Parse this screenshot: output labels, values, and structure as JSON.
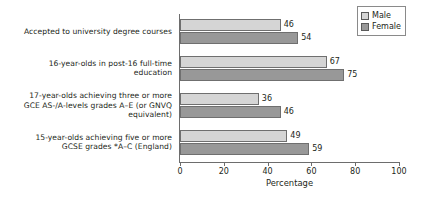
{
  "chart_data": {
    "type": "bar",
    "orientation": "horizontal",
    "title": "",
    "xlabel": "Percentage",
    "ylabel": "",
    "xlim": [
      0,
      100
    ],
    "xticks": [
      0,
      20,
      40,
      60,
      80,
      100
    ],
    "grid": false,
    "legend_position": "top-right",
    "categories": [
      "Accepted to university degree courses",
      "16-year-olds in post-16 full-time education",
      "17-year-olds achieving three or more GCE AS-/A-levels grades A–E (or GNVQ equivalent)",
      "15-year-olds achieving five or more GCSE grades *A–C (England)"
    ],
    "category_lines": [
      [
        "Accepted to university degree courses"
      ],
      [
        "16-year-olds in post-16 full-time",
        "education"
      ],
      [
        "17-year-olds achieving three or more",
        "GCE AS-/A-levels grades A–E (or GNVQ",
        "equivalent)"
      ],
      [
        "15-year-olds achieving five or more",
        "GCSE grades *A–C (England)"
      ]
    ],
    "series": [
      {
        "name": "Male",
        "color": "#d5d5d5",
        "values": [
          46,
          67,
          36,
          49
        ]
      },
      {
        "name": "Female",
        "color": "#989898",
        "values": [
          54,
          75,
          46,
          59
        ]
      }
    ]
  },
  "legend": {
    "items": [
      {
        "label": "Male"
      },
      {
        "label": "Female"
      }
    ]
  }
}
